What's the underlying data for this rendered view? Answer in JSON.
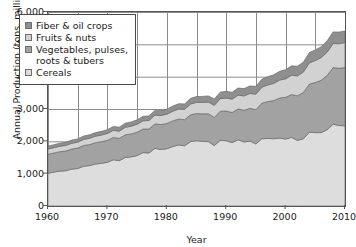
{
  "chart_data": {
    "type": "area",
    "stacked": true,
    "title": "",
    "subtitle": "",
    "xlabel": "Year",
    "ylabel": "Annual Production (tons, millions)",
    "xlim": [
      1960,
      2010
    ],
    "ylim": [
      0,
      6000
    ],
    "ytick_labels": [
      "6,000",
      "5,000",
      "4,000",
      "3,000",
      "2,000",
      "1,000",
      "0"
    ],
    "ytick_values": [
      6000,
      5000,
      4000,
      3000,
      2000,
      1000,
      0
    ],
    "xtick_labels": [
      "1960",
      "1970",
      "1980",
      "1990",
      "2000",
      "2010"
    ],
    "xtick_values": [
      1960,
      1970,
      1980,
      1990,
      2000,
      2010
    ],
    "grid": "both, minor vertical every 5 years, horizontal at each 1,000",
    "legend_position": "upper-left inside plot",
    "stack_order_bottom_to_top": [
      "Cereals",
      "Vegetables, pulses, roots & tubers",
      "Fruits & nuts",
      "Fiber & oil crops"
    ],
    "legend_entries": [
      {
        "label": "Fiber & oil crops",
        "color": "#8f8f8f"
      },
      {
        "label": "Fruits & nuts",
        "color": "#d2d2d2"
      },
      {
        "label": "Vegetables, pulses,",
        "label_line2": "roots & tubers",
        "color": "#a2a2a2"
      },
      {
        "label": "Cereals",
        "color": "#dddddd"
      }
    ],
    "x": [
      1960,
      1961,
      1962,
      1963,
      1964,
      1965,
      1966,
      1967,
      1968,
      1969,
      1970,
      1971,
      1972,
      1973,
      1974,
      1975,
      1976,
      1977,
      1978,
      1979,
      1980,
      1981,
      1982,
      1983,
      1984,
      1985,
      1986,
      1987,
      1988,
      1989,
      1990,
      1991,
      1992,
      1993,
      1994,
      1995,
      1996,
      1997,
      1998,
      1999,
      2000,
      2001,
      2002,
      2003,
      2004,
      2005,
      2006,
      2007,
      2008,
      2009,
      2010
    ],
    "series": [
      {
        "name": "Cereals",
        "color": "#dddddd",
        "values": [
          1010,
          1050,
          1080,
          1090,
          1140,
          1160,
          1230,
          1250,
          1300,
          1320,
          1350,
          1430,
          1400,
          1500,
          1520,
          1560,
          1650,
          1640,
          1780,
          1750,
          1770,
          1840,
          1890,
          1860,
          1990,
          2020,
          2000,
          1990,
          1870,
          2030,
          2020,
          1960,
          2050,
          1980,
          2010,
          1920,
          2080,
          2090,
          2080,
          2100,
          2070,
          2120,
          2030,
          2080,
          2280,
          2270,
          2270,
          2360,
          2530,
          2490,
          2480
        ]
      },
      {
        "name": "Vegetables, pulses, roots & tubers",
        "color": "#a2a2a2",
        "values": [
          590,
          590,
          600,
          610,
          620,
          630,
          640,
          650,
          660,
          670,
          680,
          690,
          690,
          700,
          710,
          720,
          730,
          740,
          760,
          770,
          780,
          790,
          800,
          810,
          830,
          840,
          850,
          860,
          870,
          900,
          920,
          930,
          950,
          980,
          1010,
          1060,
          1100,
          1140,
          1180,
          1240,
          1290,
          1330,
          1380,
          1430,
          1490,
          1550,
          1620,
          1680,
          1750,
          1770,
          1800
        ]
      },
      {
        "name": "Fruits & nuts",
        "color": "#d2d2d2",
        "values": [
          160,
          165,
          170,
          175,
          180,
          185,
          190,
          195,
          200,
          205,
          215,
          220,
          225,
          235,
          240,
          250,
          255,
          265,
          270,
          280,
          290,
          300,
          310,
          320,
          335,
          345,
          355,
          365,
          375,
          390,
          400,
          415,
          430,
          445,
          460,
          480,
          495,
          515,
          535,
          555,
          575,
          595,
          615,
          635,
          660,
          680,
          700,
          720,
          745,
          760,
          775
        ]
      },
      {
        "name": "Fiber & oil crops",
        "color": "#8f8f8f",
        "values": [
          90,
          92,
          94,
          96,
          99,
          101,
          104,
          107,
          110,
          113,
          117,
          120,
          123,
          127,
          130,
          134,
          138,
          142,
          146,
          150,
          155,
          159,
          164,
          168,
          174,
          179,
          184,
          189,
          195,
          201,
          207,
          213,
          219,
          226,
          233,
          240,
          247,
          255,
          263,
          271,
          280,
          289,
          298,
          307,
          317,
          327,
          337,
          348,
          359,
          358,
          356
        ]
      }
    ],
    "totals_note": "Total rises from ~1,850 in 1960 to a peak of ~5,250 around 2008, dipping to ~5,100 by 2010"
  }
}
